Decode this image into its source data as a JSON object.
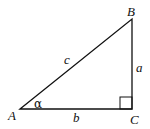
{
  "diagram": {
    "type": "right-triangle",
    "vertices": [
      {
        "name": "A",
        "x": 20,
        "y": 109
      },
      {
        "name": "B",
        "x": 132,
        "y": 19
      },
      {
        "name": "C",
        "x": 132,
        "y": 109
      }
    ],
    "sides": {
      "a": "a",
      "b": "b",
      "c": "c"
    },
    "angle_label": "α",
    "right_angle_at": "C",
    "stroke_color": "#111111"
  }
}
